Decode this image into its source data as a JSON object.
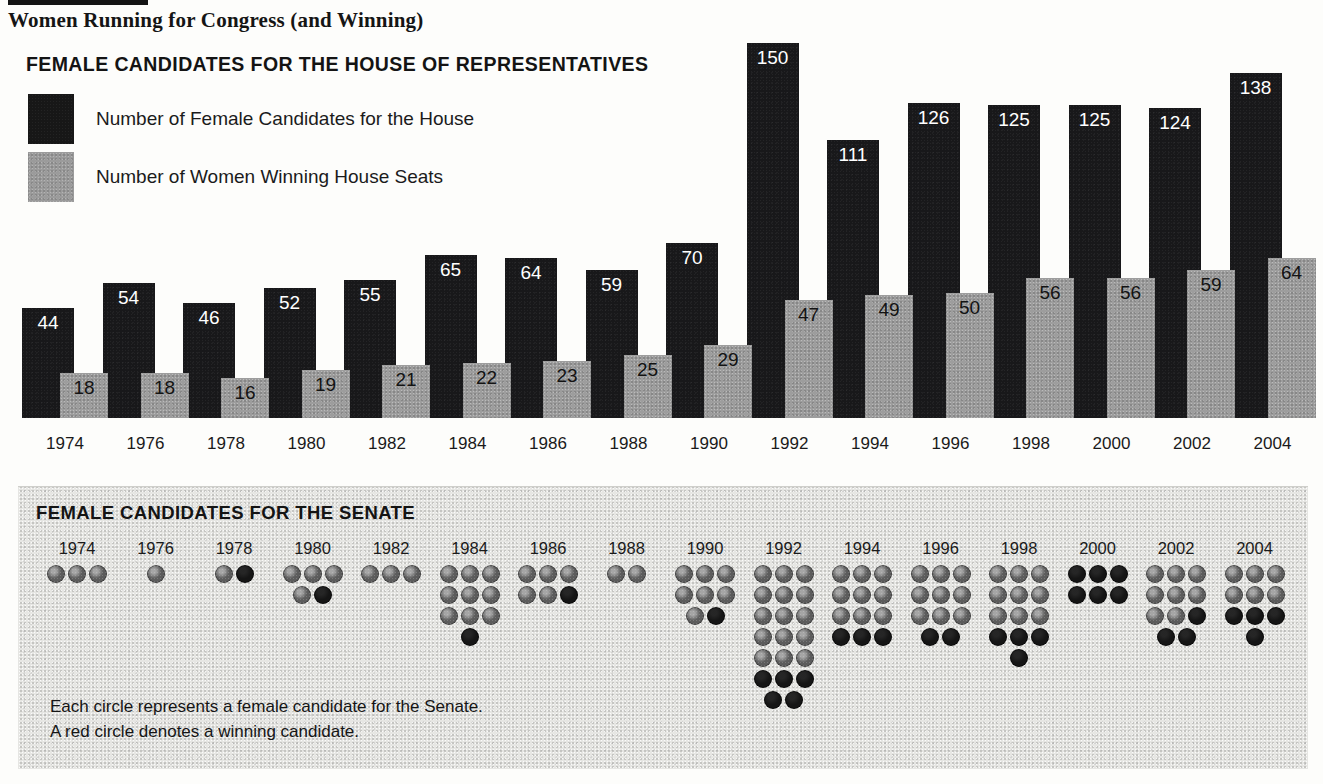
{
  "title": "Women Running for Congress (and Winning)",
  "house": {
    "heading": "FEMALE CANDIDATES FOR THE HOUSE OF REPRESENTATIVES",
    "legend": [
      {
        "key": "candidates",
        "label": "Number of Female Candidates for the House",
        "color": "#18181a"
      },
      {
        "key": "winners",
        "label": "Number of Women Winning House Seats",
        "color": "#9d9d9d"
      }
    ]
  },
  "senate": {
    "heading": "FEMALE CANDIDATES FOR THE SENATE",
    "note_line1": "Each circle represents a female candidate for the Senate.",
    "note_line2": "A red circle denotes a winning candidate.",
    "dot_colors": {
      "candidate": "#5c5c5c",
      "winner": "#151515"
    }
  },
  "chart_data": [
    {
      "type": "bar",
      "title": "FEMALE CANDIDATES FOR THE HOUSE OF REPRESENTATIVES",
      "xlabel": "",
      "ylabel": "",
      "grid": false,
      "legend_position": "top-left",
      "ylim": [
        0,
        150
      ],
      "categories": [
        "1974",
        "1976",
        "1978",
        "1980",
        "1982",
        "1984",
        "1986",
        "1988",
        "1990",
        "1992",
        "1994",
        "1996",
        "1998",
        "2000",
        "2002",
        "2004"
      ],
      "series": [
        {
          "name": "Number of Female Candidates for the House",
          "color": "#18181a",
          "values": [
            44,
            54,
            46,
            52,
            55,
            65,
            64,
            59,
            70,
            150,
            111,
            126,
            125,
            125,
            124,
            138
          ]
        },
        {
          "name": "Number of Women Winning House Seats",
          "color": "#9d9d9d",
          "values": [
            18,
            18,
            16,
            19,
            21,
            22,
            23,
            25,
            29,
            47,
            49,
            50,
            56,
            56,
            59,
            64
          ]
        }
      ]
    },
    {
      "type": "bar",
      "title": "FEMALE CANDIDATES FOR THE SENATE",
      "xlabel": "",
      "ylabel": "",
      "grid": false,
      "legend_position": "none",
      "note": "Each circle represents a female candidate for the Senate. A red circle denotes a winning candidate.",
      "categories": [
        "1974",
        "1976",
        "1978",
        "1980",
        "1982",
        "1984",
        "1986",
        "1988",
        "1990",
        "1992",
        "1994",
        "1996",
        "1998",
        "2000",
        "2002",
        "2004"
      ],
      "series": [
        {
          "name": "Female candidates for the Senate (total circles)",
          "values": [
            3,
            1,
            2,
            5,
            3,
            10,
            6,
            2,
            8,
            20,
            12,
            11,
            13,
            6,
            11,
            10
          ]
        },
        {
          "name": "Winning candidates (red circles)",
          "values": [
            0,
            0,
            1,
            1,
            0,
            1,
            1,
            0,
            1,
            5,
            3,
            2,
            4,
            6,
            3,
            4
          ]
        }
      ]
    }
  ],
  "senate_columns": [
    {
      "year": "1974",
      "rows": [
        [
          "g",
          "g",
          "g"
        ]
      ]
    },
    {
      "year": "1976",
      "rows": [
        [
          "g"
        ]
      ]
    },
    {
      "year": "1978",
      "rows": [
        [
          "g",
          "r"
        ]
      ]
    },
    {
      "year": "1980",
      "rows": [
        [
          "g",
          "g",
          "g"
        ],
        [
          "g",
          "r"
        ]
      ]
    },
    {
      "year": "1982",
      "rows": [
        [
          "g",
          "g",
          "g"
        ]
      ]
    },
    {
      "year": "1984",
      "rows": [
        [
          "g",
          "g",
          "g"
        ],
        [
          "g",
          "g",
          "g"
        ],
        [
          "g",
          "g",
          "g"
        ],
        [
          "r"
        ]
      ]
    },
    {
      "year": "1986",
      "rows": [
        [
          "g",
          "g",
          "g"
        ],
        [
          "g",
          "g",
          "r"
        ]
      ]
    },
    {
      "year": "1988",
      "rows": [
        [
          "g",
          "g"
        ]
      ]
    },
    {
      "year": "1990",
      "rows": [
        [
          "g",
          "g",
          "g"
        ],
        [
          "g",
          "g",
          "g"
        ],
        [
          "g",
          "r"
        ]
      ]
    },
    {
      "year": "1992",
      "rows": [
        [
          "g",
          "g",
          "g"
        ],
        [
          "g",
          "g",
          "g"
        ],
        [
          "g",
          "g",
          "g"
        ],
        [
          "g",
          "g",
          "g"
        ],
        [
          "g",
          "g",
          "g"
        ],
        [
          "r",
          "r",
          "r"
        ],
        [
          "r",
          "r"
        ]
      ]
    },
    {
      "year": "1994",
      "rows": [
        [
          "g",
          "g",
          "g"
        ],
        [
          "g",
          "g",
          "g"
        ],
        [
          "g",
          "g",
          "g"
        ],
        [
          "r",
          "r",
          "r"
        ]
      ]
    },
    {
      "year": "1996",
      "rows": [
        [
          "g",
          "g",
          "g"
        ],
        [
          "g",
          "g",
          "g"
        ],
        [
          "g",
          "g",
          "g"
        ],
        [
          "r",
          "r"
        ]
      ]
    },
    {
      "year": "1998",
      "rows": [
        [
          "g",
          "g",
          "g"
        ],
        [
          "g",
          "g",
          "g"
        ],
        [
          "g",
          "g",
          "g"
        ],
        [
          "r",
          "r",
          "r"
        ],
        [
          "r"
        ]
      ]
    },
    {
      "year": "2000",
      "rows": [
        [
          "r",
          "r",
          "r"
        ],
        [
          "r",
          "r",
          "r"
        ]
      ]
    },
    {
      "year": "2002",
      "rows": [
        [
          "g",
          "g",
          "g"
        ],
        [
          "g",
          "g",
          "g"
        ],
        [
          "g",
          "g",
          "r"
        ],
        [
          "r",
          "r"
        ]
      ]
    },
    {
      "year": "2004",
      "rows": [
        [
          "g",
          "g",
          "g"
        ],
        [
          "g",
          "g",
          "g"
        ],
        [
          "r",
          "r",
          "r"
        ],
        [
          "r"
        ]
      ]
    }
  ]
}
